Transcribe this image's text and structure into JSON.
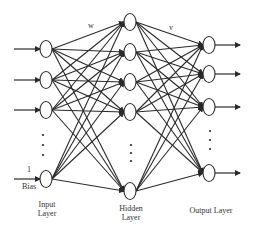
{
  "diagram": {
    "title": "",
    "colors": {
      "line": "#2a2a2a",
      "node_fill": "#ffffff",
      "node_stroke": "#2a2a2a",
      "text": "#333333"
    },
    "input_layer": {
      "label_line1": "Input",
      "label_line2": "Layer",
      "nodes": [
        {
          "x": 46,
          "y": 49
        },
        {
          "x": 46,
          "y": 80
        },
        {
          "x": 46,
          "y": 110
        }
      ],
      "bias_node": {
        "x": 46,
        "y": 179
      },
      "bias_value": "1",
      "bias_label": "Bias",
      "ellipsis": {
        "x": 43,
        "y": [
          135,
          145,
          155
        ]
      }
    },
    "hidden_layer": {
      "label_line1": "Hidden",
      "label_line2": "Layer",
      "nodes": [
        {
          "x": 130,
          "y": 22
        },
        {
          "x": 130,
          "y": 52
        },
        {
          "x": 130,
          "y": 82
        },
        {
          "x": 130,
          "y": 112
        },
        {
          "x": 130,
          "y": 191
        }
      ],
      "ellipsis": {
        "x": 131,
        "y": [
          145,
          153,
          161
        ]
      }
    },
    "output_layer": {
      "label": "Output Layer",
      "nodes": [
        {
          "x": 209,
          "y": 45
        },
        {
          "x": 209,
          "y": 74
        },
        {
          "x": 209,
          "y": 107
        },
        {
          "x": 209,
          "y": 173
        }
      ],
      "ellipsis": {
        "x": 210,
        "y": [
          131,
          140,
          149
        ]
      }
    },
    "weights": {
      "input_hidden": "w",
      "hidden_output": "v"
    }
  }
}
